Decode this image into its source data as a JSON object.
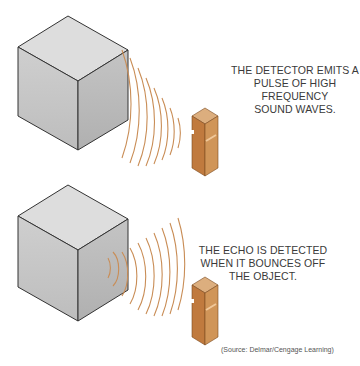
{
  "panels": [
    {
      "caption_lines": [
        "THE DETECTOR EMITS A",
        "PULSE OF HIGH FREQUENCY",
        "SOUND WAVES."
      ]
    },
    {
      "caption_lines": [
        "THE ECHO IS DETECTED",
        "WHEN IT BOUNCES OFF",
        "THE OBJECT."
      ]
    }
  ],
  "source": "(Source: Delmar/Cengage Learning)",
  "colors": {
    "cube_top": "#dcdcdc",
    "cube_front": "#c9c9c9",
    "cube_side": "#b8b8b8",
    "wave": "#c98d56",
    "detector": "#c8884a",
    "detector_top": "#dcae7e"
  }
}
